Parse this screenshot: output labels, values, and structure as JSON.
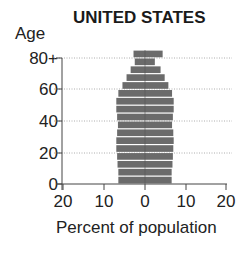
{
  "chart_data": {
    "type": "bar",
    "subtype": "population-pyramid",
    "title": "UNITED STATES",
    "ylabel": "Age",
    "xlabel": "Percent of population",
    "y_ticks": [
      "0",
      "20",
      "40",
      "60",
      "80+"
    ],
    "x_ticks": [
      "20",
      "10",
      "0",
      "10",
      "20"
    ],
    "xlim": [
      -20,
      20
    ],
    "grid": "dotted horizontal at age ticks",
    "categories": [
      "0-4",
      "5-9",
      "10-14",
      "15-19",
      "20-24",
      "25-29",
      "30-34",
      "35-39",
      "40-44",
      "45-49",
      "50-54",
      "55-59",
      "60-64",
      "65-69",
      "70-74",
      "75-79",
      "80+"
    ],
    "series": [
      {
        "name": "Left side",
        "values": [
          6.5,
          6.5,
          6.7,
          6.8,
          7.0,
          7.0,
          6.8,
          6.6,
          6.8,
          7.0,
          7.0,
          6.5,
          5.5,
          4.5,
          3.5,
          2.5,
          2.8
        ]
      },
      {
        "name": "Right side",
        "values": [
          6.5,
          6.5,
          6.7,
          6.8,
          6.9,
          7.0,
          6.9,
          6.6,
          6.8,
          7.0,
          7.0,
          6.6,
          5.7,
          4.8,
          3.8,
          2.4,
          4.3
        ]
      }
    ],
    "bar_color": "#6b6b6b"
  },
  "labels": {
    "title": "UNITED STATES",
    "ylabel": "Age",
    "xlabel": "Percent of population",
    "y_ticks": [
      "0",
      "20",
      "40",
      "60",
      "80+"
    ],
    "x_ticks": [
      "20",
      "10",
      "0",
      "10",
      "20"
    ]
  }
}
